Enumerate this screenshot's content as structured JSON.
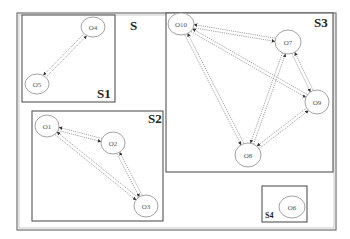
{
  "diagram": {
    "colors": {
      "border": "#555555",
      "node_stroke": "#999999",
      "edge": "#9a9a9a",
      "text": "#222222",
      "background": "#ffffff"
    },
    "outer": {
      "label": "S",
      "x": 17,
      "y": 13,
      "w": 319,
      "h": 217
    },
    "groups": [
      {
        "id": "S1",
        "label": "S1",
        "x": 22,
        "y": 15,
        "w": 93,
        "h": 87,
        "label_x": 97,
        "label_y": 98,
        "label_size": "big"
      },
      {
        "id": "S2",
        "label": "S2",
        "x": 32,
        "y": 111,
        "w": 131,
        "h": 110,
        "label_x": 148,
        "label_y": 123,
        "label_size": "big"
      },
      {
        "id": "S3",
        "label": "S3",
        "x": 166,
        "y": 13,
        "w": 167,
        "h": 159,
        "label_x": 314,
        "label_y": 27,
        "label_size": "big"
      },
      {
        "id": "S4",
        "label": "S4",
        "x": 262,
        "y": 186,
        "w": 45,
        "h": 36,
        "label_x": 265,
        "label_y": 218,
        "label_size": "small"
      }
    ],
    "nodes": [
      {
        "id": "O4",
        "label": "O4",
        "cx": 93,
        "cy": 27,
        "rx": 12,
        "ry": 10
      },
      {
        "id": "O5",
        "label": "O5",
        "cx": 37,
        "cy": 84,
        "rx": 12,
        "ry": 10
      },
      {
        "id": "O1",
        "label": "O1",
        "cx": 47,
        "cy": 126,
        "rx": 12,
        "ry": 11
      },
      {
        "id": "O2",
        "label": "O2",
        "cx": 113,
        "cy": 143,
        "rx": 12,
        "ry": 11
      },
      {
        "id": "O3",
        "label": "O3",
        "cx": 146,
        "cy": 206,
        "rx": 12,
        "ry": 11
      },
      {
        "id": "O10",
        "label": "O10",
        "cx": 181,
        "cy": 24,
        "rx": 13,
        "ry": 11
      },
      {
        "id": "O7",
        "label": "O7",
        "cx": 288,
        "cy": 42,
        "rx": 13,
        "ry": 12
      },
      {
        "id": "O9",
        "label": "O9",
        "cx": 317,
        "cy": 102,
        "rx": 12,
        "ry": 12
      },
      {
        "id": "O8",
        "label": "O8",
        "cx": 248,
        "cy": 155,
        "rx": 13,
        "ry": 12
      },
      {
        "id": "O6",
        "label": "O6",
        "cx": 292,
        "cy": 207,
        "rx": 13,
        "ry": 11
      }
    ],
    "edges": [
      {
        "from": "O4",
        "to": "O5",
        "bidirectional": true
      },
      {
        "from": "O1",
        "to": "O2",
        "bidirectional": true
      },
      {
        "from": "O1",
        "to": "O3",
        "bidirectional": true
      },
      {
        "from": "O2",
        "to": "O3",
        "bidirectional": true
      },
      {
        "from": "O10",
        "to": "O7",
        "bidirectional": true
      },
      {
        "from": "O10",
        "to": "O9",
        "bidirectional": true
      },
      {
        "from": "O10",
        "to": "O8",
        "bidirectional": true
      },
      {
        "from": "O7",
        "to": "O9",
        "bidirectional": true
      },
      {
        "from": "O7",
        "to": "O8",
        "bidirectional": true
      },
      {
        "from": "O9",
        "to": "O8",
        "bidirectional": true
      }
    ]
  }
}
